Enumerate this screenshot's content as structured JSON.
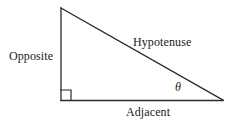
{
  "diagram": {
    "kind": "right-triangle-trigonometry",
    "background_color": "#ffffff",
    "stroke_color": "#2b2b2b",
    "text_color": "#1a1a1a",
    "stroke_width": 1.3,
    "vertices": {
      "apex": {
        "x": 61,
        "y": 8
      },
      "right_angle_corner": {
        "x": 61,
        "y": 100
      },
      "right_vertex": {
        "x": 223,
        "y": 100
      }
    },
    "right_angle_marker": {
      "x": 61,
      "y": 90,
      "size": 10,
      "present": true
    },
    "sides": [
      {
        "id": "opposite",
        "label": "Opposite",
        "from": "apex",
        "to": "right_angle_corner",
        "orientation": "vertical"
      },
      {
        "id": "hypotenuse",
        "label": "Hypotenuse",
        "from": "apex",
        "to": "right_vertex",
        "orientation": "diagonal"
      },
      {
        "id": "adjacent",
        "label": "Adjacent",
        "from": "right_angle_corner",
        "to": "right_vertex",
        "orientation": "horizontal"
      }
    ],
    "angle": {
      "id": "theta",
      "symbol": "θ",
      "at_vertex": "right_vertex"
    }
  }
}
